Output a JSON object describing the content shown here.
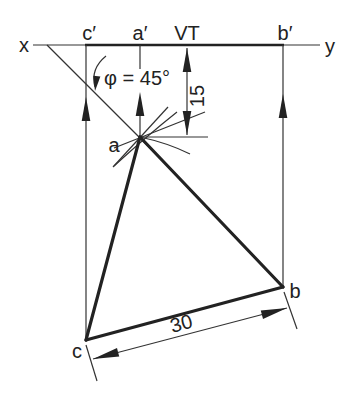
{
  "drawing": {
    "labels": {
      "x_axis_end": "x",
      "y_axis_end": "y",
      "c_prime": "c′",
      "a_prime": "a′",
      "vertical_trace": "VT",
      "b_prime": "b′",
      "point_a": "a",
      "point_b": "b",
      "point_c": "c"
    },
    "dimensions": {
      "angle": "φ = 45°",
      "depth": "15",
      "base": "30"
    },
    "colors": {
      "ink": "#222222",
      "background": "#ffffff"
    }
  }
}
